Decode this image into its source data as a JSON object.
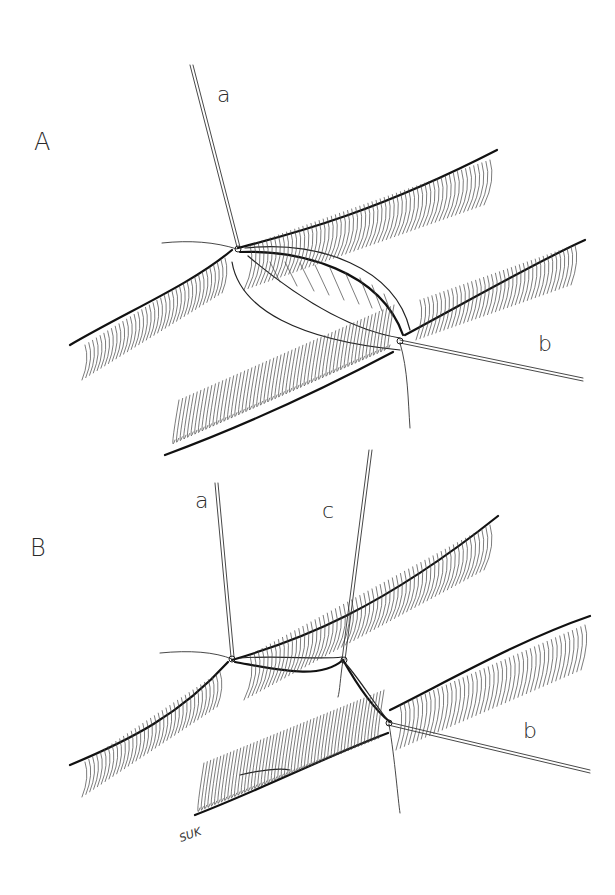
{
  "figure": {
    "panels": [
      {
        "id": "A",
        "label": "A",
        "suture_labels": [
          "a",
          "b"
        ],
        "description": "Vessel ends approximated with two stay sutures; anastomosis open"
      },
      {
        "id": "B",
        "label": "B",
        "suture_labels": [
          "a",
          "c",
          "b"
        ],
        "description": "Third stay suture added between the first two; anastomosis closed"
      }
    ],
    "signature": "SUK",
    "colors": {
      "background": "#ffffff",
      "ink": "#111111"
    }
  }
}
